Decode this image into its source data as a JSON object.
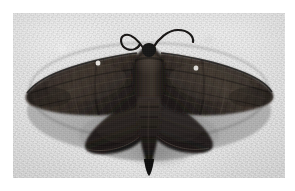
{
  "page": {
    "background_color": "#ffffff",
    "width": 295,
    "height": 191
  },
  "photo": {
    "alt_text": "Dark brown moth with wings spread flat, photographed from above on a pale gray stone surface",
    "subject": "moth",
    "background_color": "#e3e3e3",
    "frame": {
      "left": 13,
      "top": 13,
      "width": 272,
      "height": 165
    }
  },
  "moth": {
    "name": "moth-specimen",
    "body_color": "#241f1d",
    "wing_color": "#2b2522",
    "wing_highlight_color": "#4a423c",
    "shadow_color": "#565656",
    "parts": [
      {
        "name": "left-antenna",
        "label": "Left antenna, curled into a loop"
      },
      {
        "name": "right-antenna",
        "label": "Right antenna, sweeping to the right"
      },
      {
        "name": "head",
        "label": "Head"
      },
      {
        "name": "thorax",
        "label": "Thorax"
      },
      {
        "name": "abdomen",
        "label": "Abdomen tapering to a point"
      },
      {
        "name": "left-forewing",
        "label": "Left forewing"
      },
      {
        "name": "right-forewing",
        "label": "Right forewing"
      },
      {
        "name": "left-hindwing",
        "label": "Left hindwing"
      },
      {
        "name": "right-hindwing",
        "label": "Right hindwing"
      },
      {
        "name": "left-wing-spot",
        "label": "Small white spot on left forewing"
      },
      {
        "name": "right-wing-spot",
        "label": "Small white spot on right forewing"
      }
    ]
  },
  "caption": {
    "text": ""
  }
}
